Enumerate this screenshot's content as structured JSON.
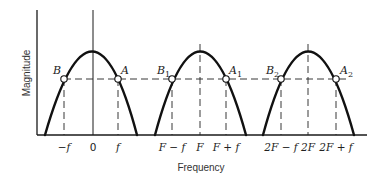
{
  "diagram": {
    "title": "",
    "y_axis_label": "Magnitude",
    "x_axis_label": "Frequency",
    "colors": {
      "curve": "#111111",
      "axis": "#1a1a1a",
      "background": "#ffffff"
    },
    "tick_labels": [
      {
        "id": "neg-f",
        "text": "−f",
        "x": 63
      },
      {
        "id": "zero",
        "text": "0",
        "x": 93
      },
      {
        "id": "f",
        "text": "f",
        "x": 118
      },
      {
        "id": "F-minus-f",
        "text": "F − f",
        "x": 172
      },
      {
        "id": "F",
        "text": "F",
        "x": 200
      },
      {
        "id": "F-plus-f",
        "text": "F + f",
        "x": 226
      },
      {
        "id": "2F-minus-f",
        "text": "2F − f",
        "x": 281
      },
      {
        "id": "2F",
        "text": "2F",
        "x": 308
      },
      {
        "id": "2F-plus-f",
        "text": "2F + f",
        "x": 336
      }
    ],
    "lobes": [
      {
        "center_label": "0",
        "points": [
          {
            "name": "B",
            "sub": ""
          },
          {
            "name": "A",
            "sub": ""
          }
        ]
      },
      {
        "center_label": "F",
        "points": [
          {
            "name": "B",
            "sub": "1"
          },
          {
            "name": "A",
            "sub": "1"
          }
        ]
      },
      {
        "center_label": "2F",
        "points": [
          {
            "name": "B",
            "sub": "2"
          },
          {
            "name": "A",
            "sub": "2"
          }
        ]
      }
    ],
    "point_labels": {
      "B": "B",
      "A": "A",
      "B1": "B",
      "B1_sub": "1",
      "A1": "A",
      "A1_sub": "1",
      "B2": "B",
      "B2_sub": "2",
      "A2": "A",
      "A2_sub": "2"
    },
    "ticks": {
      "neg_f": "−f",
      "zero": "0",
      "f": "f",
      "F_minus_f": "F − f",
      "F": "F",
      "F_plus_f": "F + f",
      "twoF_minus_f": "2F − f",
      "twoF": "2F",
      "twoF_plus_f": "2F + f"
    }
  }
}
